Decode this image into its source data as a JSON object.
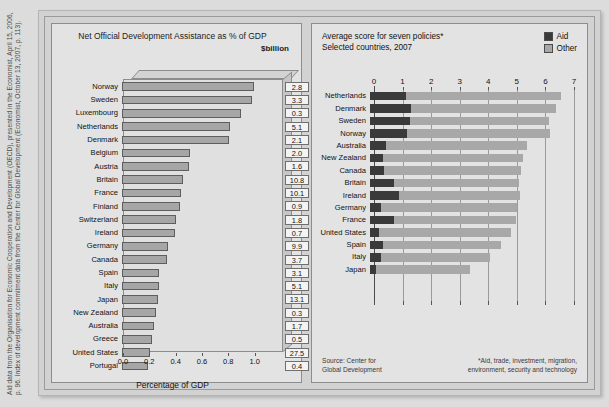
{
  "source_caption": {
    "line1": "Aid data from the Organisation for Economic Cooperation and Development (OECD), presented in the Economist, April 15, 2006,",
    "line2": "p. 96. Index of development commitment data from the Center for Global Development (Economist, October 13, 2007, p. 113)."
  },
  "left_panel": {
    "title": "Net Official Development Assistance as % of GDP",
    "unit_label": "$billion",
    "axis_label": "Percentage of GDP"
  },
  "right_panel": {
    "title_line1": "Average score for seven policies*",
    "title_line2": "Selected countries, 2007",
    "legend": [
      {
        "label": "Aid",
        "color": "#3a3a3a"
      },
      {
        "label": "Other",
        "color": "#a8a8a8"
      }
    ],
    "source_note_line1": "Source: Center for",
    "source_note_line2": "Global Development",
    "footnote_line1": "*Aid, trade, investment, migration,",
    "footnote_line2": "environment, security and technology"
  },
  "chart_data": [
    {
      "type": "bar",
      "title": "Net Official Development Assistance as % of GDP",
      "xlabel": "Percentage of GDP",
      "ylabel": "",
      "xlim": [
        0,
        1.2
      ],
      "ticks": [
        0.0,
        0.2,
        0.4,
        0.6,
        0.8,
        1.0
      ],
      "tick_labels": [
        "0.0",
        "0.2",
        "0.4",
        "0.6",
        "0.8",
        "1.0"
      ],
      "grid": false,
      "value_column_header": "$billion",
      "orientation": "horizontal",
      "categories": [
        "Norway",
        "Sweden",
        "Luxembourg",
        "Netherlands",
        "Denmark",
        "Belgium",
        "Austria",
        "Britain",
        "France",
        "Finland",
        "Switzerland",
        "Ireland",
        "Germany",
        "Canada",
        "Spain",
        "Italy",
        "Japan",
        "New Zealand",
        "Australia",
        "Greece",
        "United States",
        "Portugal"
      ],
      "values": [
        1.0,
        0.99,
        0.9,
        0.82,
        0.81,
        0.52,
        0.51,
        0.46,
        0.45,
        0.44,
        0.41,
        0.4,
        0.35,
        0.34,
        0.28,
        0.28,
        0.27,
        0.26,
        0.24,
        0.23,
        0.21,
        0.2
      ],
      "value_labels": [
        "2.8",
        "3.3",
        "0.3",
        "5.1",
        "2.1",
        "2.0",
        "1.6",
        "10.8",
        "10.1",
        "0.9",
        "1.8",
        "0.7",
        "9.9",
        "3.7",
        "3.1",
        "5.1",
        "13.1",
        "0.3",
        "1.7",
        "0.5",
        "27.5",
        "0.4"
      ]
    },
    {
      "type": "bar",
      "subtype": "stacked",
      "title": "Average score for seven policies*",
      "subtitle": "Selected countries, 2007",
      "xlabel": "",
      "ylabel": "",
      "xlim": [
        0,
        7
      ],
      "ticks": [
        0,
        1,
        2,
        3,
        4,
        5,
        6,
        7
      ],
      "tick_labels": [
        "0",
        "1",
        "2",
        "3",
        "4",
        "5",
        "6",
        "7"
      ],
      "grid": true,
      "legend_position": "top-right",
      "orientation": "horizontal",
      "categories": [
        "Netherlands",
        "Denmark",
        "Sweden",
        "Norway",
        "Australia",
        "New Zealand",
        "Canada",
        "Britain",
        "Ireland",
        "Germany",
        "France",
        "United States",
        "Spain",
        "Italy",
        "Japan"
      ],
      "series": [
        {
          "name": "Aid",
          "values": [
            1.25,
            1.45,
            1.4,
            1.3,
            0.55,
            0.45,
            0.5,
            0.85,
            1.0,
            0.4,
            0.85,
            0.3,
            0.45,
            0.4,
            0.2
          ]
        },
        {
          "name": "Other",
          "values": [
            5.45,
            5.05,
            4.85,
            5.0,
            4.95,
            4.9,
            4.8,
            4.35,
            4.25,
            4.75,
            4.25,
            4.65,
            4.15,
            3.8,
            3.3
          ]
        }
      ],
      "totals": [
        6.7,
        6.5,
        6.25,
        6.3,
        5.5,
        5.35,
        5.3,
        5.2,
        5.25,
        5.15,
        5.1,
        4.95,
        4.6,
        4.2,
        3.5
      ]
    }
  ]
}
